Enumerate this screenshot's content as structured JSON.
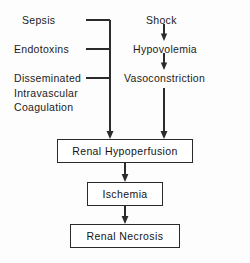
{
  "diagram": {
    "background_color": "#fdfdfd",
    "line_color": "#2b2b2b",
    "text_color": "#1b1b1b",
    "left_column": {
      "items": [
        {
          "id": "sepsis",
          "label": "Sepsis"
        },
        {
          "id": "endotoxins",
          "label": "Endotoxins"
        },
        {
          "id": "dic",
          "label": "Disseminated\nIntravascular\nCoagulation"
        }
      ]
    },
    "right_column": {
      "items": [
        {
          "id": "shock",
          "label": "Shock"
        },
        {
          "id": "hypovolemia",
          "label": "Hypovolemia"
        },
        {
          "id": "vasoconstriction",
          "label": "Vasoconstriction"
        }
      ]
    },
    "boxes": [
      {
        "id": "renal-hypoperfusion",
        "label": "Renal  Hypoperfusion"
      },
      {
        "id": "ischemia",
        "label": "Ischemia"
      },
      {
        "id": "renal-necrosis",
        "label": "Renal  Necrosis"
      }
    ]
  }
}
